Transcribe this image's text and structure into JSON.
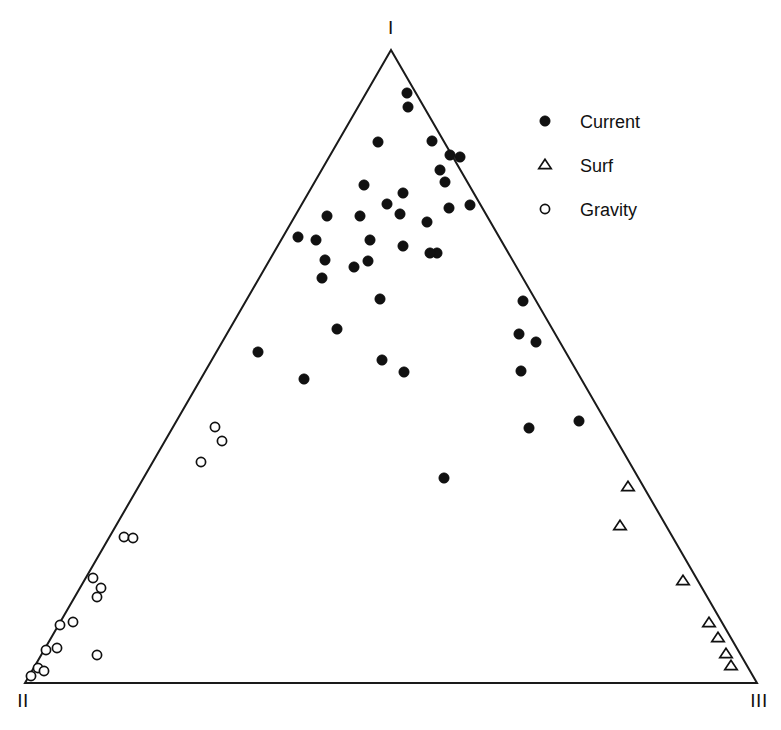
{
  "chart_data": {
    "type": "scatter",
    "plot_kind": "ternary-diagram",
    "title": "",
    "subtitle": "",
    "xlabel": "",
    "ylabel": "",
    "grid": false,
    "axis_ranges": {
      "x": [
        0,
        100
      ],
      "y": [
        0,
        100
      ]
    },
    "vertices": [
      {
        "name": "apex-top",
        "label": "I",
        "px": [
          391,
          50
        ]
      },
      {
        "name": "vertex-bottom-left",
        "label": "II",
        "px": [
          25,
          683
        ]
      },
      {
        "name": "vertex-bottom-right",
        "label": "III",
        "px": [
          757,
          683
        ]
      }
    ],
    "legend": {
      "position": "top-right",
      "entries": [
        {
          "label": "Current",
          "marker": "filled-circle",
          "color": "#111111"
        },
        {
          "label": "Surf",
          "marker": "open-triangle",
          "color": "#111111"
        },
        {
          "label": "Gravity",
          "marker": "open-circle",
          "color": "#111111"
        }
      ]
    },
    "series": [
      {
        "name": "Current",
        "marker": "filled-circle",
        "color": "#111111",
        "points_px": [
          [
            407,
            93
          ],
          [
            408,
            107
          ],
          [
            378,
            142
          ],
          [
            432,
            141
          ],
          [
            450,
            155
          ],
          [
            460,
            157
          ],
          [
            364,
            185
          ],
          [
            440,
            170
          ],
          [
            445,
            182
          ],
          [
            327,
            216
          ],
          [
            360,
            216
          ],
          [
            400,
            214
          ],
          [
            449,
            208
          ],
          [
            470,
            205
          ],
          [
            403,
            193
          ],
          [
            387,
            204
          ],
          [
            298,
            237
          ],
          [
            316,
            240
          ],
          [
            370,
            240
          ],
          [
            427,
            222
          ],
          [
            437,
            253
          ],
          [
            325,
            260
          ],
          [
            368,
            261
          ],
          [
            354,
            267
          ],
          [
            322,
            278
          ],
          [
            403,
            246
          ],
          [
            430,
            253
          ],
          [
            380,
            299
          ],
          [
            337,
            329
          ],
          [
            382,
            360
          ],
          [
            258,
            352
          ],
          [
            304,
            379
          ],
          [
            404,
            372
          ],
          [
            523,
            301
          ],
          [
            519,
            334
          ],
          [
            536,
            342
          ],
          [
            521,
            371
          ],
          [
            529,
            428
          ],
          [
            579,
            421
          ],
          [
            444,
            478
          ]
        ]
      },
      {
        "name": "Surf",
        "marker": "open-triangle",
        "color": "#111111",
        "points_px": [
          [
            628,
            487
          ],
          [
            620,
            526
          ],
          [
            683,
            581
          ],
          [
            709,
            623
          ],
          [
            718,
            638
          ],
          [
            726,
            654
          ],
          [
            731,
            666
          ]
        ]
      },
      {
        "name": "Gravity",
        "marker": "open-circle",
        "color": "#111111",
        "points_px": [
          [
            215,
            427
          ],
          [
            222,
            441
          ],
          [
            201,
            462
          ],
          [
            124,
            537
          ],
          [
            133,
            538
          ],
          [
            93,
            578
          ],
          [
            101,
            588
          ],
          [
            97,
            597
          ],
          [
            60,
            625
          ],
          [
            73,
            622
          ],
          [
            97,
            655
          ],
          [
            46,
            650
          ],
          [
            57,
            648
          ],
          [
            38,
            668
          ],
          [
            44,
            671
          ],
          [
            31,
            676
          ]
        ]
      }
    ]
  },
  "figure": {
    "background": "#ffffff",
    "line_color": "#1a1a1a"
  }
}
